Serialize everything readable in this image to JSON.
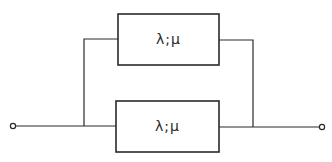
{
  "diagram": {
    "type": "parallel-redundant-system",
    "components": [
      {
        "id": "top-element",
        "label": "λ;μ"
      },
      {
        "id": "bottom-element",
        "label": "λ;μ"
      }
    ],
    "terminals": [
      {
        "id": "input",
        "side": "left"
      },
      {
        "id": "output",
        "side": "right"
      }
    ],
    "colors": {
      "line": "#2a2a2a",
      "background": "#ffffff"
    }
  }
}
